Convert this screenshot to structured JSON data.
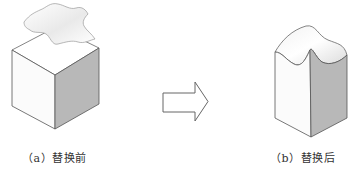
{
  "figure": {
    "panels": [
      {
        "id": "a",
        "caption": "（a）替换前",
        "description": "cube with wavy surface sheet floating above it"
      },
      {
        "id": "b",
        "caption": "（b）替换后",
        "description": "box whose top face replaced by wavy surface"
      }
    ],
    "arrow": {
      "direction": "right",
      "icon": "arrow-right-outline-icon"
    },
    "colors": {
      "face_light": "#fbfbfb",
      "face_dark": "#b9b9b9",
      "edge": "#555555"
    }
  }
}
